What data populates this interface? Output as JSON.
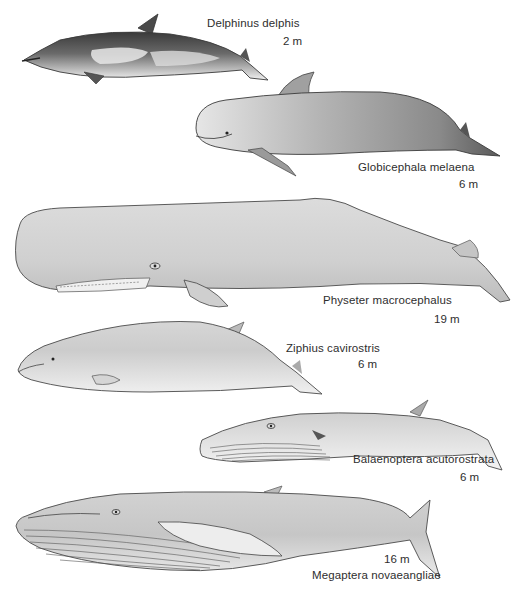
{
  "plate": {
    "title": "Whale species comparison illustration",
    "background": "#ffffff",
    "ink": "#2e2e2e",
    "species": [
      {
        "id": "delphinus",
        "name": "Delphinus delphis",
        "length": "2 m"
      },
      {
        "id": "globicephala",
        "name": "Globicephala melaena",
        "length": "6 m"
      },
      {
        "id": "physeter",
        "name": "Physeter macrocephalus",
        "length": "19 m"
      },
      {
        "id": "ziphius",
        "name": "Ziphius cavirostris",
        "length": "6 m"
      },
      {
        "id": "balaenoptera",
        "name": "Balaenoptera acutorostrata",
        "length": "6 m"
      },
      {
        "id": "megaptera",
        "name": "Megaptera novaeangliae",
        "length": "16 m"
      }
    ]
  }
}
